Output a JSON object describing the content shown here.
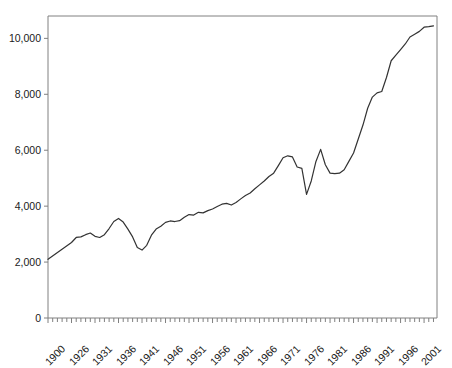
{
  "chart_data": {
    "type": "line",
    "title": "",
    "subtitle": "",
    "xlabel": "",
    "ylabel": "",
    "xlim": [
      1900,
      2003
    ],
    "ylim": [
      0,
      10800
    ],
    "grid": false,
    "legend": "none",
    "line_color": "#333333",
    "axis_color": "#808080",
    "text_color": "#1a1a1a",
    "ytick_labels": [
      "0",
      "2,000",
      "4,000",
      "6,000",
      "8,000",
      "10,000"
    ],
    "ytick_values": [
      0,
      2000,
      4000,
      6000,
      8000,
      10000
    ],
    "xtick_labels": [
      "1900",
      "1926",
      "1931",
      "1936",
      "1941",
      "1946",
      "1951",
      "1956",
      "1961",
      "1966",
      "1971",
      "1976",
      "1981",
      "1986",
      "1991",
      "1996",
      "2001"
    ],
    "xtick_values": [
      1900,
      1926,
      1931,
      1936,
      1941,
      1946,
      1951,
      1956,
      1961,
      1966,
      1971,
      1976,
      1981,
      1986,
      1991,
      1996,
      2001
    ],
    "minor_tick_interval": 1,
    "x": [
      1900,
      1926,
      1927,
      1928,
      1929,
      1930,
      1931,
      1932,
      1933,
      1934,
      1935,
      1936,
      1937,
      1938,
      1939,
      1940,
      1941,
      1942,
      1943,
      1944,
      1945,
      1946,
      1947,
      1948,
      1949,
      1950,
      1951,
      1952,
      1953,
      1954,
      1955,
      1956,
      1957,
      1958,
      1959,
      1960,
      1961,
      1962,
      1963,
      1964,
      1965,
      1966,
      1967,
      1968,
      1969,
      1970,
      1971,
      1972,
      1973,
      1974,
      1975,
      1976,
      1977,
      1978,
      1979,
      1980,
      1981,
      1982,
      1983,
      1984,
      1985,
      1986,
      1987,
      1988,
      1989,
      1990,
      1991,
      1992,
      1993,
      1994,
      1995,
      1996,
      1997,
      1998,
      1999,
      2000,
      2001,
      2002,
      2003
    ],
    "values": [
      2100,
      2700,
      2880,
      2900,
      2980,
      3040,
      2920,
      2880,
      2980,
      3200,
      3450,
      3560,
      3430,
      3180,
      2900,
      2520,
      2430,
      2600,
      2960,
      3180,
      3280,
      3420,
      3470,
      3450,
      3480,
      3600,
      3700,
      3680,
      3780,
      3760,
      3840,
      3900,
      3990,
      4070,
      4100,
      4040,
      4130,
      4260,
      4380,
      4470,
      4620,
      4760,
      4900,
      5060,
      5180,
      5450,
      5730,
      5800,
      5760,
      5400,
      5350,
      4420,
      4900,
      5600,
      6030,
      5480,
      5180,
      5160,
      5180,
      5300,
      5600,
      5900,
      6400,
      6900,
      7500,
      7900,
      8050,
      8100,
      8600,
      9200,
      9400,
      9600,
      9800,
      10050,
      10150,
      10250,
      10400,
      10420,
      10450
    ],
    "annotations": []
  }
}
